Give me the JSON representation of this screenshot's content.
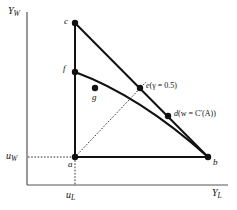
{
  "figure": {
    "type": "economics-diagram",
    "background_color": "#ffffff",
    "line_color": "#111111",
    "axes": {
      "y_label": "Y",
      "y_label_sub": "W",
      "x_label": "Y",
      "x_label_sub": "L",
      "y_tick_label": "u",
      "y_tick_label_sub": "W",
      "x_tick_label": "u",
      "x_tick_label_sub": "L"
    },
    "points": [
      {
        "id": "a",
        "label": "a",
        "x": 75,
        "y": 157
      },
      {
        "id": "b",
        "label": "b",
        "x": 208,
        "y": 157
      },
      {
        "id": "c",
        "label": "c",
        "x": 75,
        "y": 23
      },
      {
        "id": "d",
        "label": "d",
        "x": 168,
        "y": 116
      },
      {
        "id": "e",
        "label": "e",
        "x": 140,
        "y": 88
      },
      {
        "id": "f",
        "label": "f",
        "x": 75,
        "y": 72
      },
      {
        "id": "g",
        "label": "g",
        "x": 95,
        "y": 88
      }
    ],
    "annotations": {
      "e_note": "(γ = 0.5)",
      "d_note": "(w = C′(A))"
    },
    "point_labels": {
      "a": "a",
      "b": "b",
      "c": "c",
      "d": "d",
      "e": "e",
      "f": "f",
      "g": "g"
    }
  }
}
